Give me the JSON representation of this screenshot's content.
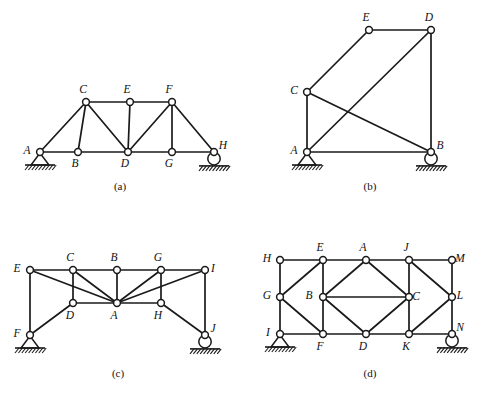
{
  "figure": {
    "background_color": "#ffffff",
    "line_color": "#1a1a1a",
    "joint_fill": "#ffffff"
  },
  "panels": [
    {
      "id": "a",
      "caption": "(a)",
      "caption_pos": {
        "x": 90,
        "y": 180
      },
      "origin": {
        "x": 0,
        "y": 0
      },
      "size": {
        "w": 249,
        "h": 198
      },
      "nodes": [
        {
          "label": "A",
          "x": 40,
          "y": 152,
          "label_dx": -13,
          "label_dy": 2
        },
        {
          "label": "B",
          "x": 78,
          "y": 152,
          "label_dx": -3,
          "label_dy": 15
        },
        {
          "label": "C",
          "x": 86,
          "y": 102,
          "label_dx": -3,
          "label_dy": -9
        },
        {
          "label": "D",
          "x": 128,
          "y": 152,
          "label_dx": -3,
          "label_dy": 15
        },
        {
          "label": "E",
          "x": 130,
          "y": 102,
          "label_dx": -3,
          "label_dy": -9
        },
        {
          "label": "F",
          "x": 172,
          "y": 102,
          "label_dx": -3,
          "label_dy": -9
        },
        {
          "label": "G",
          "x": 172,
          "y": 152,
          "label_dx": -3,
          "label_dy": 15
        },
        {
          "label": "H",
          "x": 214,
          "y": 152,
          "label_dx": 9,
          "label_dy": -3
        }
      ],
      "members": [
        [
          "A",
          "B"
        ],
        [
          "B",
          "D"
        ],
        [
          "D",
          "G"
        ],
        [
          "G",
          "H"
        ],
        [
          "C",
          "E"
        ],
        [
          "E",
          "F"
        ],
        [
          "A",
          "C"
        ],
        [
          "C",
          "B"
        ],
        [
          "C",
          "D"
        ],
        [
          "E",
          "D"
        ],
        [
          "F",
          "D"
        ],
        [
          "F",
          "G"
        ],
        [
          "F",
          "H"
        ]
      ],
      "supports": [
        {
          "type": "pin",
          "node": "A"
        },
        {
          "type": "roller",
          "node": "H"
        }
      ]
    },
    {
      "id": "b",
      "caption": "(b)",
      "caption_pos": {
        "x": 340,
        "y": 180
      },
      "origin": {
        "x": 249,
        "y": 0
      },
      "size": {
        "w": 249,
        "h": 198
      },
      "nodes": [
        {
          "label": "A",
          "x": 58,
          "y": 152,
          "label_dx": -13,
          "label_dy": 2
        },
        {
          "label": "B",
          "x": 182,
          "y": 152,
          "label_dx": 9,
          "label_dy": -3
        },
        {
          "label": "C",
          "x": 58,
          "y": 92,
          "label_dx": -13,
          "label_dy": 2
        },
        {
          "label": "D",
          "x": 182,
          "y": 30,
          "label_dx": -2,
          "label_dy": -9
        },
        {
          "label": "E",
          "x": 120,
          "y": 30,
          "label_dx": -3,
          "label_dy": -9
        }
      ],
      "members": [
        [
          "A",
          "B"
        ],
        [
          "A",
          "C"
        ],
        [
          "C",
          "E"
        ],
        [
          "E",
          "D"
        ],
        [
          "D",
          "B"
        ],
        [
          "C",
          "B"
        ],
        [
          "A",
          "D"
        ]
      ],
      "supports": [
        {
          "type": "pin",
          "node": "A"
        },
        {
          "type": "roller",
          "node": "B"
        }
      ]
    },
    {
      "id": "c",
      "caption": "(c)",
      "caption_pos": {
        "x": 88,
        "y": 367
      },
      "origin": {
        "x": 0,
        "y": 198
      },
      "size": {
        "w": 249,
        "h": 198
      },
      "nodes": [
        {
          "label": "E",
          "x": 30,
          "y": 72,
          "label_dx": -13,
          "label_dy": 2
        },
        {
          "label": "C",
          "x": 73,
          "y": 72,
          "label_dx": -3,
          "label_dy": -9
        },
        {
          "label": "B",
          "x": 117,
          "y": 72,
          "label_dx": -3,
          "label_dy": -9
        },
        {
          "label": "G",
          "x": 161,
          "y": 72,
          "label_dx": -3,
          "label_dy": -9
        },
        {
          "label": "I",
          "x": 205,
          "y": 72,
          "label_dx": 8,
          "label_dy": 2
        },
        {
          "label": "D",
          "x": 73,
          "y": 105,
          "label_dx": -3,
          "label_dy": 16
        },
        {
          "label": "A",
          "x": 117,
          "y": 105,
          "label_dx": -3,
          "label_dy": 16
        },
        {
          "label": "H",
          "x": 161,
          "y": 105,
          "label_dx": -3,
          "label_dy": 16
        },
        {
          "label": "F",
          "x": 30,
          "y": 137,
          "label_dx": -13,
          "label_dy": 2
        },
        {
          "label": "J",
          "x": 205,
          "y": 137,
          "label_dx": 8,
          "label_dy": -3
        }
      ],
      "members": [
        [
          "E",
          "C"
        ],
        [
          "C",
          "B"
        ],
        [
          "B",
          "G"
        ],
        [
          "G",
          "I"
        ],
        [
          "E",
          "F"
        ],
        [
          "I",
          "J"
        ],
        [
          "C",
          "D"
        ],
        [
          "G",
          "H"
        ],
        [
          "E",
          "A"
        ],
        [
          "C",
          "A"
        ],
        [
          "B",
          "A"
        ],
        [
          "G",
          "A"
        ],
        [
          "I",
          "A"
        ],
        [
          "D",
          "A"
        ],
        [
          "H",
          "A"
        ],
        [
          "F",
          "D"
        ],
        [
          "H",
          "J"
        ]
      ],
      "supports": [
        {
          "type": "pin",
          "node": "F"
        },
        {
          "type": "roller",
          "node": "J"
        }
      ]
    },
    {
      "id": "d",
      "caption": "(d)",
      "caption_pos": {
        "x": 340,
        "y": 367
      },
      "origin": {
        "x": 249,
        "y": 198
      },
      "size": {
        "w": 249,
        "h": 198
      },
      "nodes": [
        {
          "label": "H",
          "x": 31,
          "y": 62,
          "label_dx": -13,
          "label_dy": 2
        },
        {
          "label": "E",
          "x": 74,
          "y": 62,
          "label_dx": -3,
          "label_dy": -9
        },
        {
          "label": "A",
          "x": 117,
          "y": 62,
          "label_dx": -3,
          "label_dy": -9
        },
        {
          "label": "J",
          "x": 160,
          "y": 62,
          "label_dx": -3,
          "label_dy": -9
        },
        {
          "label": "M",
          "x": 203,
          "y": 62,
          "label_dx": 8,
          "label_dy": 2
        },
        {
          "label": "G",
          "x": 31,
          "y": 99,
          "label_dx": -13,
          "label_dy": 2
        },
        {
          "label": "B",
          "x": 74,
          "y": 99,
          "label_dx": -14,
          "label_dy": 2
        },
        {
          "label": "C",
          "x": 160,
          "y": 99,
          "label_dx": 7,
          "label_dy": 3
        },
        {
          "label": "L",
          "x": 203,
          "y": 99,
          "label_dx": 8,
          "label_dy": 2
        },
        {
          "label": "I",
          "x": 31,
          "y": 136,
          "label_dx": -12,
          "label_dy": 2
        },
        {
          "label": "F",
          "x": 74,
          "y": 136,
          "label_dx": -3,
          "label_dy": 16
        },
        {
          "label": "D",
          "x": 117,
          "y": 136,
          "label_dx": -3,
          "label_dy": 16
        },
        {
          "label": "K",
          "x": 160,
          "y": 136,
          "label_dx": -3,
          "label_dy": 16
        },
        {
          "label": "N",
          "x": 203,
          "y": 136,
          "label_dx": 8,
          "label_dy": -3
        }
      ],
      "members": [
        [
          "H",
          "E"
        ],
        [
          "E",
          "A"
        ],
        [
          "A",
          "J"
        ],
        [
          "J",
          "M"
        ],
        [
          "I",
          "F"
        ],
        [
          "F",
          "D"
        ],
        [
          "D",
          "K"
        ],
        [
          "K",
          "N"
        ],
        [
          "H",
          "G"
        ],
        [
          "G",
          "I"
        ],
        [
          "M",
          "L"
        ],
        [
          "L",
          "N"
        ],
        [
          "G",
          "E"
        ],
        [
          "E",
          "B"
        ],
        [
          "G",
          "F"
        ],
        [
          "F",
          "B"
        ],
        [
          "B",
          "A"
        ],
        [
          "A",
          "C"
        ],
        [
          "B",
          "D"
        ],
        [
          "D",
          "C"
        ],
        [
          "B",
          "C"
        ],
        [
          "C",
          "J"
        ],
        [
          "J",
          "L"
        ],
        [
          "C",
          "K"
        ],
        [
          "K",
          "L"
        ]
      ],
      "supports": [
        {
          "type": "pin",
          "node": "I"
        },
        {
          "type": "roller",
          "node": "N"
        }
      ]
    }
  ]
}
